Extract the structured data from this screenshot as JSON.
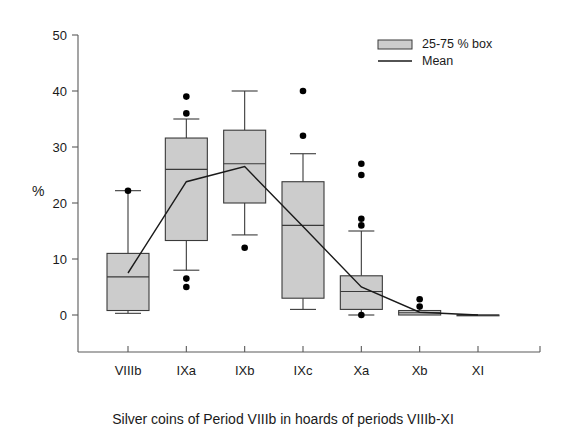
{
  "chart_data": {
    "type": "box",
    "title": "",
    "caption": "Silver coins of Period VIIIb in hoards of periods VIIIb-XI",
    "xlabel": "",
    "ylabel": "%",
    "ylim": [
      0,
      50
    ],
    "yticks": [
      0,
      10,
      20,
      30,
      40,
      50
    ],
    "ytick_labels": [
      "0",
      "10",
      "20",
      "30",
      "40",
      "50"
    ],
    "grid": false,
    "categories": [
      "VIIIb",
      "IXa",
      "IXb",
      "IXc",
      "Xa",
      "Xb",
      "XI"
    ],
    "legend": {
      "position": "top-right",
      "entries": [
        {
          "label": "25-75 % box",
          "marker": "filled-box"
        },
        {
          "label": "Mean",
          "marker": "line"
        }
      ]
    },
    "boxes": [
      {
        "category": "VIIIb",
        "whisker_low": 0.3,
        "q1": 0.8,
        "median": 6.8,
        "q3": 11.0,
        "whisker_high": 22.2,
        "outliers": [
          22.2
        ]
      },
      {
        "category": "IXa",
        "whisker_low": 8.0,
        "q1": 13.3,
        "median": 26.0,
        "q3": 31.6,
        "whisker_high": 35.0,
        "outliers": [
          39.0,
          36.0,
          6.5,
          5.0
        ]
      },
      {
        "category": "IXb",
        "whisker_low": 14.3,
        "q1": 20.0,
        "median": 27.0,
        "q3": 33.0,
        "whisker_high": 40.0,
        "outliers": [
          12.0
        ]
      },
      {
        "category": "IXc",
        "whisker_low": 1.0,
        "q1": 3.0,
        "median": 16.0,
        "q3": 23.8,
        "whisker_high": 28.8,
        "outliers": [
          40.0,
          32.0
        ]
      },
      {
        "category": "Xa",
        "whisker_low": 0.0,
        "q1": 1.0,
        "median": 4.2,
        "q3": 7.0,
        "whisker_high": 15.0,
        "outliers": [
          27.0,
          25.0,
          17.2,
          16.0,
          0.0
        ]
      },
      {
        "category": "Xb",
        "whisker_low": 0.0,
        "q1": 0.0,
        "median": 0.4,
        "q3": 0.8,
        "whisker_high": 0.8,
        "outliers": [
          2.8,
          1.5
        ]
      },
      {
        "category": "XI",
        "whisker_low": 0.0,
        "q1": 0.0,
        "median": 0.0,
        "q3": 0.0,
        "whisker_high": 0.0,
        "outliers": []
      }
    ],
    "series": [
      {
        "name": "Mean",
        "values": [
          7.5,
          23.8,
          26.5,
          15.8,
          5.0,
          0.5,
          0.0
        ]
      }
    ]
  }
}
